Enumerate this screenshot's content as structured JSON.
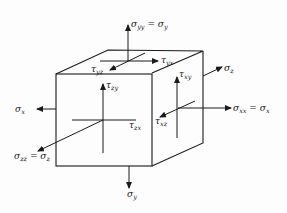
{
  "diagram": {
    "type": "stress-element-cube",
    "colors": {
      "ink": "#1a1a1a",
      "background": "#fdfdfd"
    },
    "labels": {
      "sigma_yy_top": {
        "base": "σ",
        "sub": "yy",
        "eq": " = σ",
        "sub2": "y"
      },
      "tau_yx": {
        "base": "τ",
        "sub": "yx"
      },
      "tau_yz": {
        "base": "τ",
        "sub": "yz"
      },
      "sigma_z": {
        "base": "σ",
        "sub": "z"
      },
      "tau_xy": {
        "base": "τ",
        "sub": "xy"
      },
      "tau_zy": {
        "base": "τ",
        "sub": "zy"
      },
      "sigma_x_left": {
        "base": "σ",
        "sub": "x"
      },
      "sigma_xx_right": {
        "base": "σ",
        "sub": "xx",
        "eq": " = σ",
        "sub2": "x"
      },
      "tau_xz": {
        "base": "τ",
        "sub": "xz"
      },
      "tau_zx": {
        "base": "τ",
        "sub": "zx"
      },
      "sigma_zz_front": {
        "base": "σ",
        "sub": "zz",
        "eq": " = σ",
        "sub2": "z"
      },
      "sigma_y_bottom": {
        "base": "σ",
        "sub": "y"
      }
    }
  }
}
